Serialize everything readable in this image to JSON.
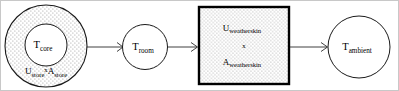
{
  "diagram": {
    "type": "thermal-network-block-diagram",
    "canvas": {
      "width": 399,
      "height": 91,
      "background": "#ffffff",
      "border_color": "#c8c8c8"
    },
    "nodes": [
      {
        "id": "store",
        "shape": "circle-in-circle",
        "fill_pattern": "stipple",
        "inner_label_main": "T",
        "inner_label_sub": "core",
        "bottom_label_1_main": "U",
        "bottom_label_1_sub": "store",
        "bottom_label_op": "x",
        "bottom_label_2_main": "A",
        "bottom_label_2_sub": "store"
      },
      {
        "id": "room",
        "shape": "circle",
        "fill_pattern": "none",
        "label_main": "T",
        "label_sub": "room"
      },
      {
        "id": "weatherskin",
        "shape": "rectangle",
        "fill_pattern": "stipple",
        "line1_main": "U",
        "line1_sub": "weatherskin",
        "line2": "x",
        "line3_main": "A",
        "line3_sub": "weatherskin"
      },
      {
        "id": "ambient",
        "shape": "circle",
        "fill_pattern": "none",
        "label_main": "T",
        "label_sub": "ambient"
      }
    ],
    "edges": [
      {
        "id": "store-to-room",
        "from": "store",
        "to": "room",
        "arrow": "open-chevron"
      },
      {
        "id": "room-to-weatherskin",
        "from": "room",
        "to": "weatherskin",
        "arrow": "open-chevron"
      },
      {
        "id": "weatherskin-to-ambient",
        "from": "weatherskin",
        "to": "ambient",
        "arrow": "open-chevron"
      }
    ]
  }
}
